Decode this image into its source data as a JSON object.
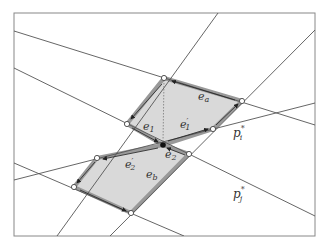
{
  "diagram": {
    "frame": {
      "x": 14,
      "y": 13,
      "width": 301,
      "height": 223
    },
    "colors": {
      "line": "#555555",
      "frame": "#888888",
      "fill": "#d9d9d9",
      "edge_outline": "#888888",
      "vertex_fill": "#ffffff",
      "dot": "#111111"
    },
    "labels": {
      "ea": {
        "text": "e",
        "sub": "a",
        "x": 198,
        "y": 100
      },
      "eb": {
        "text": "e",
        "sub": "b",
        "x": 146,
        "y": 178
      },
      "e1": {
        "text": "e",
        "sub": "1",
        "x": 143,
        "y": 130
      },
      "e1p": {
        "text": "e",
        "sub": "1",
        "prime": "′",
        "x": 180,
        "y": 128
      },
      "e2": {
        "text": "e",
        "sub": "2",
        "x": 165,
        "y": 158
      },
      "e2p": {
        "text": "e",
        "sub": "2",
        "prime": "′",
        "x": 125,
        "y": 168
      },
      "pi": {
        "text": "p",
        "sub": "i",
        "sup": "*",
        "x": 233,
        "y": 137
      },
      "pj": {
        "text": "p",
        "sub": "j",
        "sup": "*",
        "x": 233,
        "y": 198
      }
    }
  }
}
